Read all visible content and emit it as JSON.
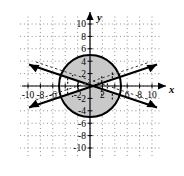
{
  "figure": {
    "kind": "coordinate-graph",
    "axis_labels": {
      "x": "x",
      "y": "y"
    },
    "x_tick_labels": [
      "-10",
      "-8",
      "-6",
      "-2",
      "2",
      "6",
      "8",
      "10"
    ],
    "y_tick_labels": [
      "10",
      "8",
      "6",
      "4",
      "2",
      "-2",
      "-4",
      "-6",
      "-8",
      "-10"
    ],
    "colors": {
      "ink": "#000000",
      "shade": "#c9c9c9",
      "grid": "#8a8a8a",
      "background": "#ffffff"
    }
  },
  "chart_data": {
    "type": "scatter",
    "title": "",
    "xlabel": "x",
    "ylabel": "y",
    "xlim": [
      -11,
      11
    ],
    "ylim": [
      -11,
      11
    ],
    "grid": true,
    "grid_step": 2,
    "x_ticks": [
      -10,
      -8,
      -6,
      -4,
      -2,
      2,
      4,
      6,
      8,
      10
    ],
    "y_ticks": [
      10,
      8,
      6,
      4,
      2,
      -2,
      -4,
      -6,
      -8,
      -10
    ],
    "x_tick_labels_shown": [
      "-10",
      "-8",
      "-6",
      "-2",
      "2",
      "6",
      "8",
      "10"
    ],
    "y_tick_labels_shown": [
      "10",
      "8",
      "6",
      "4",
      "2",
      "-2",
      "-4",
      "-6",
      "-8",
      "-10"
    ],
    "legend": [],
    "annotations": [],
    "series": [
      {
        "name": "circle",
        "type": "curve",
        "equation": "x^2 + y^2 = 25",
        "center": [
          0,
          0
        ],
        "radius": 5,
        "style": "solid",
        "closed": true
      },
      {
        "name": "line-positive-slope",
        "type": "line",
        "equation": "y = 0.35x",
        "slope": 0.35,
        "intercept": 0,
        "style": "solid",
        "arrows": "both",
        "x_range": [
          -11,
          11
        ]
      },
      {
        "name": "line-negative-slope",
        "type": "line",
        "equation": "y = -0.35x",
        "slope": -0.35,
        "intercept": 0,
        "style": "solid",
        "arrows": "both",
        "x_range": [
          -11,
          11
        ]
      }
    ],
    "shaded_regions": [
      {
        "name": "upper-cap",
        "description": "circle cap above both lines",
        "fill": "#c9c9c9"
      },
      {
        "name": "lower-cap",
        "description": "circle cap below both lines",
        "fill": "#c9c9c9"
      }
    ],
    "hatch_marks": {
      "description": "short dashed tick marks inside the circle pointing toward the solution region",
      "style": "dashed"
    }
  }
}
